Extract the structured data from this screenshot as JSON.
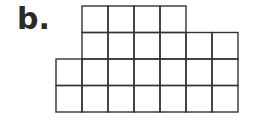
{
  "label": "b.",
  "grid": {
    "cell_size": 26,
    "origin_x": 56,
    "origin_y": 6,
    "line_color": "#333333",
    "rows": [
      {
        "start_col": 1,
        "end_col": 5
      },
      {
        "start_col": 1,
        "end_col": 7
      },
      {
        "start_col": 0,
        "end_col": 7
      },
      {
        "start_col": 0,
        "end_col": 7
      }
    ],
    "total_squares": 24
  }
}
